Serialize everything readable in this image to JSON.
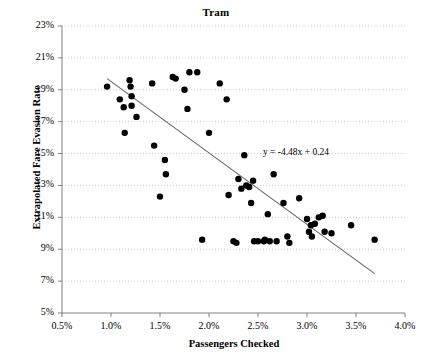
{
  "chart_data": {
    "type": "scatter",
    "title": "Tram",
    "xlabel": "Passengers Checked",
    "ylabel": "Extrapolated Fare Evasion Rate",
    "xlim": [
      0.5,
      4.0
    ],
    "ylim": [
      5,
      23
    ],
    "x_ticks": [
      "0.5%",
      "1.0%",
      "1.5%",
      "2.0%",
      "2.5%",
      "3.0%",
      "3.5%",
      "4.0%"
    ],
    "x_tick_values": [
      0.5,
      1.0,
      1.5,
      2.0,
      2.5,
      3.0,
      3.5,
      4.0
    ],
    "y_ticks": [
      "5%",
      "7%",
      "9%",
      "11%",
      "13%",
      "15%",
      "17%",
      "19%",
      "21%",
      "23%"
    ],
    "y_tick_values": [
      5,
      7,
      9,
      11,
      13,
      15,
      17,
      19,
      21,
      23
    ],
    "grid": true,
    "grid_style": "dotted",
    "legend": "none",
    "marker_color": "#000000",
    "marker_size": 3.2,
    "trendline": {
      "equation": "y = -4.48x + 0.24",
      "slope": -4.48,
      "intercept": 0.24,
      "color": "#666666",
      "x_start": 0.96,
      "x_end": 3.69
    },
    "points": [
      {
        "x": 0.96,
        "y": 19.2
      },
      {
        "x": 1.09,
        "y": 18.4
      },
      {
        "x": 1.13,
        "y": 17.9
      },
      {
        "x": 1.14,
        "y": 16.3
      },
      {
        "x": 1.19,
        "y": 19.6
      },
      {
        "x": 1.2,
        "y": 19.2
      },
      {
        "x": 1.21,
        "y": 18.6
      },
      {
        "x": 1.21,
        "y": 18.0
      },
      {
        "x": 1.26,
        "y": 17.3
      },
      {
        "x": 1.42,
        "y": 19.4
      },
      {
        "x": 1.44,
        "y": 15.5
      },
      {
        "x": 1.5,
        "y": 12.3
      },
      {
        "x": 1.55,
        "y": 14.6
      },
      {
        "x": 1.56,
        "y": 13.7
      },
      {
        "x": 1.63,
        "y": 19.8
      },
      {
        "x": 1.66,
        "y": 19.7
      },
      {
        "x": 1.75,
        "y": 19.0
      },
      {
        "x": 1.78,
        "y": 17.8
      },
      {
        "x": 1.8,
        "y": 20.1
      },
      {
        "x": 1.88,
        "y": 20.1
      },
      {
        "x": 1.93,
        "y": 9.6
      },
      {
        "x": 2.0,
        "y": 16.3
      },
      {
        "x": 2.11,
        "y": 19.4
      },
      {
        "x": 2.18,
        "y": 18.4
      },
      {
        "x": 2.2,
        "y": 12.4
      },
      {
        "x": 2.25,
        "y": 9.5
      },
      {
        "x": 2.28,
        "y": 9.4
      },
      {
        "x": 2.3,
        "y": 13.4
      },
      {
        "x": 2.33,
        "y": 12.8
      },
      {
        "x": 2.36,
        "y": 14.9
      },
      {
        "x": 2.38,
        "y": 13.0
      },
      {
        "x": 2.41,
        "y": 12.9
      },
      {
        "x": 2.43,
        "y": 11.9
      },
      {
        "x": 2.45,
        "y": 13.3
      },
      {
        "x": 2.46,
        "y": 9.5
      },
      {
        "x": 2.5,
        "y": 9.5
      },
      {
        "x": 2.56,
        "y": 9.5
      },
      {
        "x": 2.57,
        "y": 9.6
      },
      {
        "x": 2.6,
        "y": 11.2
      },
      {
        "x": 2.62,
        "y": 9.5
      },
      {
        "x": 2.66,
        "y": 13.7
      },
      {
        "x": 2.69,
        "y": 9.5
      },
      {
        "x": 2.76,
        "y": 11.9
      },
      {
        "x": 2.8,
        "y": 9.8
      },
      {
        "x": 2.82,
        "y": 9.4
      },
      {
        "x": 2.92,
        "y": 12.2
      },
      {
        "x": 3.0,
        "y": 10.9
      },
      {
        "x": 3.02,
        "y": 10.1
      },
      {
        "x": 3.04,
        "y": 10.5
      },
      {
        "x": 3.05,
        "y": 9.8
      },
      {
        "x": 3.08,
        "y": 10.6
      },
      {
        "x": 3.12,
        "y": 11.0
      },
      {
        "x": 3.16,
        "y": 11.1
      },
      {
        "x": 3.18,
        "y": 10.1
      },
      {
        "x": 3.25,
        "y": 10.0
      },
      {
        "x": 3.45,
        "y": 10.5
      },
      {
        "x": 3.69,
        "y": 9.6
      }
    ]
  }
}
